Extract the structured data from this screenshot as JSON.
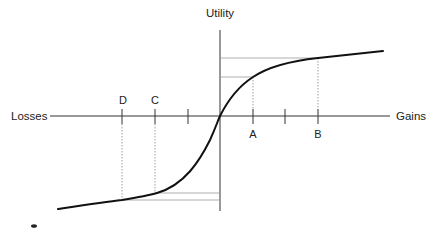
{
  "diagram": {
    "type": "utility-function",
    "axes": {
      "y_label": "Utility",
      "x_negative_label": "Losses",
      "x_positive_label": "Gains"
    },
    "points": [
      {
        "label": "D",
        "side": "losses"
      },
      {
        "label": "C",
        "side": "losses"
      },
      {
        "label": "A",
        "side": "gains"
      },
      {
        "label": "B",
        "side": "gains"
      }
    ],
    "colors": {
      "curve": "#111111",
      "axis": "#333333",
      "guide": "#888888"
    }
  }
}
